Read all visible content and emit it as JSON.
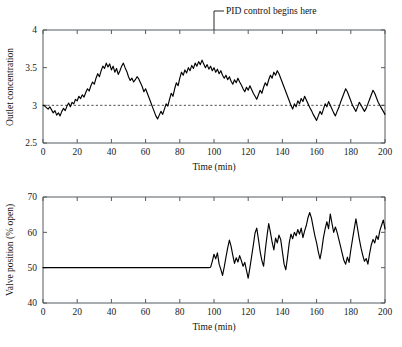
{
  "figure": {
    "background": "#ffffff",
    "trace_color": "#000000",
    "axis_color": "#555a5e",
    "setpoint_color": "#3a3a3a"
  },
  "annotation": {
    "text": "PID control begins here",
    "target_x": 100,
    "leader_label": "pid-control-leader"
  },
  "chart_data": [
    {
      "type": "line",
      "id": "outlet-concentration",
      "title": "",
      "xlabel": "Time (min)",
      "ylabel": "Outlet concentration",
      "xlim": [
        0,
        200
      ],
      "ylim": [
        2.5,
        4
      ],
      "xticks": [
        0,
        20,
        40,
        60,
        80,
        100,
        120,
        140,
        160,
        180,
        200
      ],
      "xticklabels": [
        "0",
        "20",
        "40",
        "60",
        "80",
        "100",
        "120",
        "140",
        "160",
        "180",
        "200"
      ],
      "yticks": [
        2.5,
        3,
        3.5,
        4
      ],
      "yticklabels": [
        "2.5",
        "3",
        "3.5",
        "4"
      ],
      "grid": false,
      "legend": null,
      "setpoint": 3,
      "annotations": [
        {
          "text": "PID control begins here",
          "x": 100,
          "y": 4
        }
      ],
      "series": [
        {
          "name": "Outlet concentration",
          "color": "#000000",
          "x": [
            0,
            1,
            2,
            3,
            4,
            5,
            6,
            7,
            8,
            9,
            10,
            11,
            12,
            13,
            14,
            15,
            16,
            17,
            18,
            19,
            20,
            21,
            22,
            23,
            24,
            25,
            26,
            27,
            28,
            29,
            30,
            31,
            32,
            33,
            34,
            35,
            36,
            37,
            38,
            39,
            40,
            41,
            42,
            43,
            44,
            45,
            46,
            47,
            48,
            49,
            50,
            51,
            52,
            53,
            54,
            55,
            56,
            57,
            58,
            59,
            60,
            61,
            62,
            63,
            64,
            65,
            66,
            67,
            68,
            69,
            70,
            71,
            72,
            73,
            74,
            75,
            76,
            77,
            78,
            79,
            80,
            81,
            82,
            83,
            84,
            85,
            86,
            87,
            88,
            89,
            90,
            91,
            92,
            93,
            94,
            95,
            96,
            97,
            98,
            99,
            100,
            101,
            102,
            103,
            104,
            105,
            106,
            107,
            108,
            109,
            110,
            111,
            112,
            113,
            114,
            115,
            116,
            117,
            118,
            119,
            120,
            121,
            122,
            123,
            124,
            125,
            126,
            127,
            128,
            129,
            130,
            131,
            132,
            133,
            134,
            135,
            136,
            137,
            138,
            139,
            140,
            141,
            142,
            143,
            144,
            145,
            146,
            147,
            148,
            149,
            150,
            151,
            152,
            153,
            154,
            155,
            156,
            157,
            158,
            159,
            160,
            161,
            162,
            163,
            164,
            165,
            166,
            167,
            168,
            169,
            170,
            171,
            172,
            173,
            174,
            175,
            176,
            177,
            178,
            179,
            180,
            181,
            182,
            183,
            184,
            185,
            186,
            187,
            188,
            189,
            190,
            191,
            192,
            193,
            194,
            195,
            196,
            197,
            198,
            199,
            200
          ],
          "values": [
            3.0,
            2.99,
            2.97,
            2.95,
            2.98,
            2.94,
            2.9,
            2.93,
            2.87,
            2.9,
            2.86,
            2.92,
            2.96,
            2.93,
            2.99,
            3.03,
            2.98,
            3.04,
            3.02,
            3.08,
            3.06,
            3.12,
            3.09,
            3.14,
            3.11,
            3.17,
            3.22,
            3.19,
            3.26,
            3.31,
            3.28,
            3.36,
            3.42,
            3.38,
            3.46,
            3.52,
            3.49,
            3.56,
            3.51,
            3.55,
            3.47,
            3.52,
            3.44,
            3.49,
            3.41,
            3.46,
            3.52,
            3.56,
            3.5,
            3.45,
            3.38,
            3.33,
            3.36,
            3.31,
            3.34,
            3.38,
            3.35,
            3.3,
            3.25,
            3.18,
            3.22,
            3.16,
            3.1,
            3.04,
            2.98,
            2.92,
            2.86,
            2.82,
            2.87,
            2.92,
            2.88,
            2.95,
            3.02,
            2.99,
            3.08,
            3.16,
            3.12,
            3.22,
            3.3,
            3.26,
            3.36,
            3.44,
            3.4,
            3.47,
            3.43,
            3.5,
            3.46,
            3.53,
            3.49,
            3.56,
            3.52,
            3.58,
            3.54,
            3.6,
            3.55,
            3.5,
            3.54,
            3.48,
            3.52,
            3.46,
            3.5,
            3.44,
            3.48,
            3.42,
            3.46,
            3.4,
            3.36,
            3.4,
            3.34,
            3.38,
            3.32,
            3.28,
            3.34,
            3.3,
            3.36,
            3.31,
            3.27,
            3.22,
            3.18,
            3.24,
            3.2,
            3.26,
            3.21,
            3.16,
            3.12,
            3.08,
            3.14,
            3.2,
            3.16,
            3.24,
            3.3,
            3.26,
            3.34,
            3.4,
            3.36,
            3.44,
            3.4,
            3.46,
            3.42,
            3.36,
            3.3,
            3.24,
            3.18,
            3.12,
            3.06,
            3.0,
            2.95,
            3.02,
            2.98,
            3.06,
            3.02,
            3.09,
            3.05,
            3.12,
            3.07,
            3.02,
            2.97,
            2.93,
            2.88,
            2.84,
            2.8,
            2.86,
            2.92,
            2.88,
            2.95,
            3.02,
            2.98,
            3.05,
            3.0,
            2.95,
            2.9,
            2.86,
            2.92,
            2.97,
            3.04,
            3.1,
            3.16,
            3.22,
            3.18,
            3.12,
            3.06,
            3.0,
            2.96,
            2.92,
            2.98,
            3.04,
            3.0,
            2.96,
            2.92,
            2.96,
            3.02,
            3.08,
            3.14,
            3.2,
            3.16,
            3.1,
            3.04,
            3.0,
            2.96,
            2.92,
            2.88,
            2.93,
            2.98,
            2.94,
            2.9,
            2.95,
            2.91
          ]
        }
      ]
    },
    {
      "type": "line",
      "id": "valve-position",
      "title": "",
      "xlabel": "Time (min)",
      "ylabel": "Valve position (% open)",
      "xlim": [
        0,
        200
      ],
      "ylim": [
        40,
        70
      ],
      "xticks": [
        0,
        20,
        40,
        60,
        80,
        100,
        120,
        140,
        160,
        180,
        200
      ],
      "xticklabels": [
        "0",
        "20",
        "40",
        "60",
        "80",
        "100",
        "120",
        "140",
        "160",
        "180",
        "200"
      ],
      "yticks": [
        40,
        50,
        60,
        70
      ],
      "yticklabels": [
        "40",
        "50",
        "60",
        "70"
      ],
      "grid": false,
      "legend": null,
      "control_start_x": 98,
      "series": [
        {
          "name": "Valve position",
          "color": "#000000",
          "x": [
            0,
            5,
            10,
            15,
            20,
            25,
            30,
            35,
            40,
            45,
            50,
            55,
            60,
            65,
            70,
            75,
            80,
            85,
            90,
            95,
            97,
            98,
            99,
            100,
            101,
            102,
            103,
            104,
            105,
            106,
            107,
            108,
            109,
            110,
            111,
            112,
            113,
            114,
            115,
            116,
            117,
            118,
            119,
            120,
            121,
            122,
            123,
            124,
            125,
            126,
            127,
            128,
            129,
            130,
            131,
            132,
            133,
            134,
            135,
            136,
            137,
            138,
            139,
            140,
            141,
            142,
            143,
            144,
            145,
            146,
            147,
            148,
            149,
            150,
            151,
            152,
            153,
            154,
            155,
            156,
            157,
            158,
            159,
            160,
            161,
            162,
            163,
            164,
            165,
            166,
            167,
            168,
            169,
            170,
            171,
            172,
            173,
            174,
            175,
            176,
            177,
            178,
            179,
            180,
            181,
            182,
            183,
            184,
            185,
            186,
            187,
            188,
            189,
            190,
            191,
            192,
            193,
            194,
            195,
            196,
            197,
            198,
            199,
            200
          ],
          "values": [
            50.0,
            50.0,
            50.0,
            50.0,
            50.0,
            50.0,
            50.0,
            50.0,
            50.0,
            50.0,
            50.0,
            50.0,
            50.0,
            50.0,
            50.0,
            50.0,
            50.0,
            50.0,
            50.0,
            50.0,
            50.0,
            50.1,
            51.8,
            53.8,
            52.5,
            54.2,
            51.0,
            49.5,
            47.8,
            50.2,
            53.0,
            55.6,
            57.8,
            56.0,
            53.5,
            51.2,
            52.8,
            51.6,
            53.4,
            52.0,
            50.4,
            51.5,
            49.2,
            47.0,
            50.0,
            53.2,
            56.4,
            59.8,
            61.2,
            58.0,
            54.5,
            52.0,
            50.4,
            55.0,
            59.0,
            62.5,
            60.0,
            57.2,
            55.0,
            58.4,
            57.0,
            59.2,
            58.0,
            54.5,
            51.0,
            49.4,
            53.0,
            57.0,
            59.5,
            58.2,
            60.0,
            59.0,
            60.8,
            59.5,
            61.2,
            58.5,
            60.4,
            62.0,
            64.2,
            65.6,
            64.0,
            61.5,
            59.0,
            57.0,
            54.5,
            52.5,
            55.0,
            58.5,
            61.0,
            63.0,
            61.0,
            65.2,
            62.5,
            60.0,
            61.5,
            60.0,
            58.0,
            56.0,
            54.0,
            52.0,
            51.0,
            53.0,
            51.5,
            55.0,
            58.0,
            61.0,
            63.8,
            61.0,
            58.0,
            55.5,
            53.5,
            51.8,
            52.6,
            51.0,
            54.0,
            56.5,
            58.0,
            57.0,
            59.0,
            58.0,
            60.5,
            62.0,
            63.5,
            61.0
          ]
        }
      ]
    }
  ]
}
